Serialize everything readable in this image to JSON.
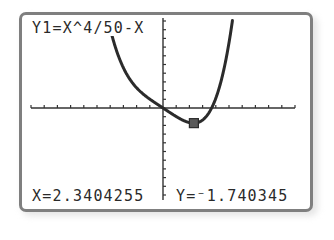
{
  "calculator": {
    "function_label": "Y1=X^4/50-X",
    "x_readout": "X=2.3404255",
    "y_readout": "Y=⁻1.740345"
  },
  "colors": {
    "border": "#7f7f7f",
    "curve": "#2b2b2b",
    "axis": "#333333",
    "cursor_fill": "#5a5a5a"
  },
  "chart_data": {
    "type": "line",
    "title": "Y1=X^4/50-X",
    "xlabel": "",
    "ylabel": "",
    "xlim": [
      -10,
      10
    ],
    "ylim": [
      -10,
      10
    ],
    "grid": false,
    "tick_step_x": 1,
    "tick_step_y": 1,
    "series": [
      {
        "name": "Y1",
        "expression": "x^4/50 - x",
        "x": [
          -4.0,
          -3.0,
          -2.0,
          -1.0,
          0.0,
          1.0,
          2.0,
          2.3404255,
          3.0,
          4.0,
          5.0,
          5.3
        ],
        "values": [
          9.12,
          4.62,
          2.32,
          1.02,
          0.0,
          -0.98,
          -1.68,
          -1.740345,
          -1.38,
          1.12,
          7.5,
          10.5
        ]
      }
    ],
    "trace_cursor": {
      "x": 2.3404255,
      "y": -1.740345
    }
  }
}
